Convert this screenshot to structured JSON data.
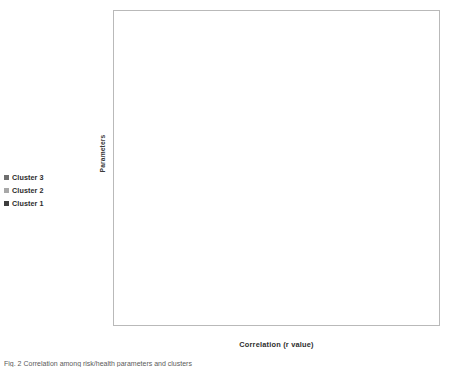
{
  "figure": {
    "caption": "Fig. 2  Correlation among risk/health parameters and clusters"
  },
  "axes": {
    "ylabel": "Parameters",
    "xlabel": "Correlation (r value)",
    "xticks": [
      "-1.00",
      "-0.80",
      "-0.60",
      "-0.40",
      "-0.20",
      "0.00",
      "0.20",
      "0.40",
      "0.60",
      "0.80",
      "1.00"
    ]
  },
  "legend": {
    "position": "left",
    "items": [
      {
        "label": "Cluster 3",
        "color": "#6f6f6f"
      },
      {
        "label": "Cluster 2",
        "color": "#a8a8a8"
      },
      {
        "label": "Cluster 1",
        "color": "#3d3d3d"
      }
    ]
  },
  "chart_data": {
    "type": "bar",
    "orientation": "horizontal",
    "title": "",
    "xlabel": "Correlation (r value)",
    "ylabel": "Parameters",
    "xlim": [
      -1.0,
      1.0
    ],
    "xtick_step": 0.2,
    "grid": true,
    "legend_position": "left",
    "categories": [
      "Anaemia",
      "Contraceptive",
      "Colostrum",
      "Adequate Diet",
      "ANC",
      "Pre Conception",
      "Sanitation",
      "Spacing",
      "Woman menstruation",
      "Exclusive breast feeding",
      "Anaemia Women",
      "Health",
      "Safe Delivery",
      "Nutrition",
      "Immunization",
      "Growth Monitoring"
    ],
    "series": [
      {
        "name": "Cluster 3",
        "color": "#6f6f6f",
        "values": [
          0.21,
          -0.33,
          0.18,
          -0.01,
          0.03,
          -0.28,
          -0.05,
          0.2,
          0.54,
          -0.28,
          0.26,
          -0.45,
          -0.22,
          -0.48,
          0.1,
          0.28
        ]
      },
      {
        "name": "Cluster 2",
        "color": "#a8a8a8",
        "values": [
          0.83,
          -0.59,
          -0.43,
          -0.3,
          -0.74,
          -0.55,
          -0.9,
          -0.75,
          -0.74,
          -0.01,
          0.74,
          -0.53,
          -0.01,
          -0.01,
          -0.46,
          -0.86
        ]
      },
      {
        "name": "Cluster 1",
        "color": "#3d3d3d",
        "values": [
          0.08,
          -0.37,
          0.14,
          0.04,
          -0.16,
          -0.25,
          -0.19,
          -0.07,
          0.48,
          -0.38,
          0.24,
          -0.41,
          -0.31,
          -0.41,
          0.26,
          -0.37
        ]
      }
    ],
    "value_labels": [
      {
        "category": "Anaemia",
        "series": "Cluster 3",
        "text": "0.21"
      },
      {
        "category": "Anaemia",
        "series": "Cluster 2",
        "text": "0.83"
      },
      {
        "category": "Anaemia",
        "series": "Cluster 1",
        "text": "0.08"
      },
      {
        "category": "Contraceptive",
        "series": "Cluster 3",
        "text": "-0.33"
      },
      {
        "category": "Contraceptive",
        "series": "Cluster 2",
        "text": "-0.59"
      },
      {
        "category": "Contraceptive",
        "series": "Cluster 1",
        "text": "-0.37"
      },
      {
        "category": "Colostrum",
        "series": "Cluster 3",
        "text": "0.18"
      },
      {
        "category": "Colostrum",
        "series": "Cluster 2",
        "text": "-0.43"
      },
      {
        "category": "Colostrum",
        "series": "Cluster 1",
        "text": "0.14"
      },
      {
        "category": "Adequate Diet",
        "series": "Cluster 3",
        "text": "-0.01"
      },
      {
        "category": "Adequate Diet",
        "series": "Cluster 2",
        "text": "-0.30"
      },
      {
        "category": "Adequate Diet",
        "series": "Cluster 1",
        "text": "0.04"
      },
      {
        "category": "ANC",
        "series": "Cluster 3",
        "text": "0.03"
      },
      {
        "category": "ANC",
        "series": "Cluster 2",
        "text": "-0.74"
      },
      {
        "category": "ANC",
        "series": "Cluster 1",
        "text": "-0.16"
      },
      {
        "category": "Pre Conception",
        "series": "Cluster 3",
        "text": "-0.28"
      },
      {
        "category": "Pre Conception",
        "series": "Cluster 2",
        "text": "-0.55"
      },
      {
        "category": "Pre Conception",
        "series": "Cluster 1",
        "text": "-0.25"
      },
      {
        "category": "Sanitation",
        "series": "Cluster 3",
        "text": "-0.05"
      },
      {
        "category": "Sanitation",
        "series": "Cluster 2",
        "text": "-0.90"
      },
      {
        "category": "Sanitation",
        "series": "Cluster 1",
        "text": "-0.19"
      },
      {
        "category": "Spacing",
        "series": "Cluster 3",
        "text": "0.20"
      },
      {
        "category": "Spacing",
        "series": "Cluster 2",
        "text": "-0.75"
      },
      {
        "category": "Spacing",
        "series": "Cluster 1",
        "text": "-0.07"
      },
      {
        "category": "Woman menstruation",
        "series": "Cluster 3",
        "text": "0.54"
      },
      {
        "category": "Woman menstruation",
        "series": "Cluster 2",
        "text": "-0.74"
      },
      {
        "category": "Woman menstruation",
        "series": "Cluster 1",
        "text": "0.48"
      },
      {
        "category": "Exclusive breast feeding",
        "series": "Cluster 3",
        "text": "-0.28"
      },
      {
        "category": "Exclusive breast feeding",
        "series": "Cluster 2",
        "text": "-0.01"
      },
      {
        "category": "Exclusive breast feeding",
        "series": "Cluster 1",
        "text": "-0.38"
      },
      {
        "category": "Anaemia Women",
        "series": "Cluster 3",
        "text": "0.26"
      },
      {
        "category": "Anaemia Women",
        "series": "Cluster 2",
        "text": "0.74"
      },
      {
        "category": "Anaemia Women",
        "series": "Cluster 1",
        "text": "0.24"
      },
      {
        "category": "Health",
        "series": "Cluster 3",
        "text": "-0.45"
      },
      {
        "category": "Health",
        "series": "Cluster 2",
        "text": "-0.53"
      },
      {
        "category": "Health",
        "series": "Cluster 1",
        "text": "-0.41"
      },
      {
        "category": "Safe Delivery",
        "series": "Cluster 3",
        "text": "-0.22"
      },
      {
        "category": "Safe Delivery",
        "series": "Cluster 2",
        "text": "-0.01"
      },
      {
        "category": "Safe Delivery",
        "series": "Cluster 1",
        "text": "-0.31"
      },
      {
        "category": "Nutrition",
        "series": "Cluster 3",
        "text": "-0.48"
      },
      {
        "category": "Nutrition",
        "series": "Cluster 2",
        "text": "-0.01"
      },
      {
        "category": "Nutrition",
        "series": "Cluster 1",
        "text": "-0.41"
      },
      {
        "category": "Immunization",
        "series": "Cluster 3",
        "text": "0.10"
      },
      {
        "category": "Immunization",
        "series": "Cluster 2",
        "text": "-0.46"
      },
      {
        "category": "Immunization",
        "series": "Cluster 1",
        "text": "0.26"
      },
      {
        "category": "Growth Monitoring",
        "series": "Cluster 3",
        "text": "0.28"
      },
      {
        "category": "Growth Monitoring",
        "series": "Cluster 2",
        "text": "-0.86"
      },
      {
        "category": "Growth Monitoring",
        "series": "Cluster 1",
        "text": "-0.37"
      }
    ]
  }
}
